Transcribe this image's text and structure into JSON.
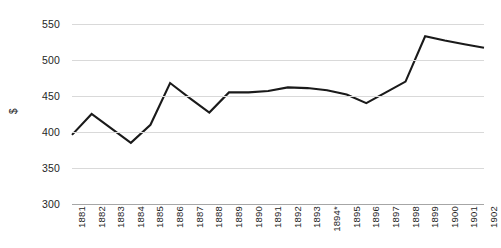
{
  "chart_data": {
    "type": "line",
    "title": "",
    "xlabel": "",
    "ylabel": "$",
    "ylim": [
      300,
      550
    ],
    "ytick_step": 50,
    "yticks": [
      550,
      500,
      450,
      400,
      350,
      300
    ],
    "grid": true,
    "legend": "none",
    "categories": [
      "1881",
      "1882",
      "1883",
      "1884",
      "1885",
      "1886",
      "1887",
      "1888",
      "1889",
      "1890",
      "1891",
      "1892",
      "1893",
      "1894*",
      "1895",
      "1896",
      "1897",
      "1898",
      "1899",
      "1900",
      "1901",
      "1902"
    ],
    "values": [
      396,
      425,
      405,
      385,
      410,
      468,
      447,
      427,
      455,
      455,
      457,
      462,
      461,
      458,
      452,
      440,
      455,
      470,
      533,
      527,
      522,
      517
    ],
    "series": [
      {
        "name": "",
        "color": "#1a1a1a",
        "values": [
          396,
          425,
          405,
          385,
          410,
          468,
          447,
          427,
          455,
          455,
          457,
          462,
          461,
          458,
          452,
          440,
          455,
          470,
          533,
          527,
          522,
          517
        ]
      }
    ],
    "annotations": [
      "1894*"
    ],
    "colors": {
      "line": "#1a1a1a",
      "gridline": "#d9d9d9",
      "baseline": "#a6a6a6",
      "text": "#262626",
      "background": "#ffffff"
    }
  }
}
